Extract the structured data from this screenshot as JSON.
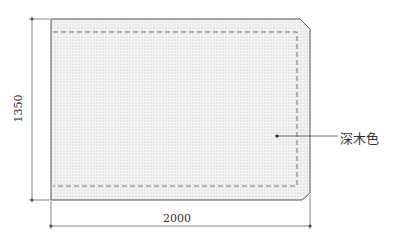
{
  "diagram": {
    "type": "panel-drawing",
    "dimensions": {
      "width_label": "2000",
      "height_label": "1350"
    },
    "callouts": [
      {
        "label": "深木色",
        "target": "panel-surface"
      }
    ],
    "colors": {
      "outline": "#555555",
      "fill_dots": "#c8c8c8",
      "dashed": "#666666",
      "dimension_line": "#555555"
    }
  }
}
